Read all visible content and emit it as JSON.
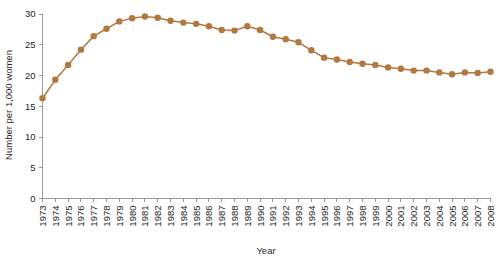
{
  "chart_data": {
    "type": "line",
    "title": "",
    "xlabel": "Year",
    "ylabel": "Number per 1,000 women",
    "categories": [
      "1973",
      "1974",
      "1975",
      "1976",
      "1977",
      "1978",
      "1979",
      "1980",
      "1981",
      "1982",
      "1983",
      "1984",
      "1985",
      "1986",
      "1987",
      "1988",
      "1989",
      "1990",
      "1991",
      "1992",
      "1993",
      "1994",
      "1995",
      "1996",
      "1997",
      "1998",
      "1999",
      "2000",
      "2001",
      "2002",
      "2003",
      "2004",
      "2005",
      "2006",
      "2007",
      "2008"
    ],
    "values": [
      16.3,
      19.3,
      21.7,
      24.2,
      26.4,
      27.6,
      28.8,
      29.3,
      29.6,
      29.4,
      28.9,
      28.6,
      28.4,
      28.0,
      27.4,
      27.3,
      28.0,
      27.4,
      26.3,
      25.9,
      25.4,
      24.1,
      22.9,
      22.6,
      22.2,
      21.9,
      21.7,
      21.3,
      21.1,
      20.8,
      20.8,
      20.5,
      20.2,
      20.5,
      20.4,
      20.6
    ],
    "ylim": [
      0,
      30
    ],
    "yticks": [
      0,
      5,
      10,
      15,
      20,
      25,
      30
    ],
    "ytick_labels": [
      "0",
      "5",
      "10",
      "15",
      "20",
      "25",
      "30"
    ],
    "xlim": [
      "1973",
      "2008"
    ],
    "grid": false,
    "legend": null,
    "series_color": "#b1793f",
    "marker": "circle",
    "marker_size": 3.2,
    "axis_color": "#9a9a9a"
  }
}
